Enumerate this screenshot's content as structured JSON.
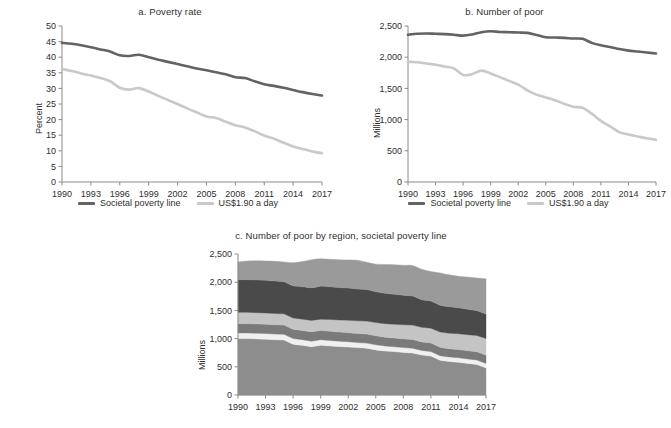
{
  "figure": {
    "background": "#ffffff",
    "series_colors": {
      "societal_poverty_line": "#636363",
      "us190_a_day": "#c9c9c9"
    },
    "region_colors": {
      "east_asia_pacific": "#8d8d8d",
      "europe_central_asia": "#f0f0f0",
      "latin_america_caribbean": "#7a7a7a",
      "middle_east_north_africa": "#c4c4c4",
      "south_asia": "#4a4a4a",
      "sub_saharan_africa": "#9a9a9a"
    }
  },
  "legend": {
    "items": [
      {
        "label": "Societal poverty line",
        "color": "#636363"
      },
      {
        "label": "US$1.90 a day",
        "color": "#c9c9c9"
      }
    ]
  },
  "chart_data": [
    {
      "id": "panel-a",
      "type": "line",
      "title": "a. Poverty rate",
      "xlabel": "",
      "ylabel": "Percent",
      "xlim": [
        1990,
        2017
      ],
      "ylim": [
        0,
        50
      ],
      "ytick_step": 5,
      "grid": false,
      "legend_position": "bottom",
      "yticks": [
        "0",
        "5",
        "10",
        "15",
        "20",
        "25",
        "30",
        "35",
        "40",
        "45",
        "50"
      ],
      "xticks": [
        "1990",
        "1993",
        "1996",
        "1999",
        "2002",
        "2005",
        "2008",
        "2011",
        "2014",
        "2017"
      ],
      "x": [
        1990,
        1991,
        1992,
        1993,
        1994,
        1995,
        1996,
        1997,
        1998,
        1999,
        2000,
        2001,
        2002,
        2003,
        2004,
        2005,
        2006,
        2007,
        2008,
        2009,
        2010,
        2011,
        2012,
        2013,
        2014,
        2015,
        2016,
        2017
      ],
      "series": [
        {
          "name": "Societal poverty line",
          "color": "#636363",
          "values": [
            44.6,
            44.3,
            43.8,
            43.2,
            42.5,
            41.8,
            40.6,
            40.4,
            40.8,
            40.0,
            39.2,
            38.5,
            37.8,
            37.1,
            36.4,
            35.8,
            35.2,
            34.5,
            33.6,
            33.3,
            32.3,
            31.3,
            30.8,
            30.2,
            29.5,
            28.8,
            28.2,
            27.7
          ]
        },
        {
          "name": "US$1.90 a day",
          "color": "#c9c9c9",
          "values": [
            36.2,
            35.6,
            34.8,
            34.1,
            33.3,
            32.3,
            30.2,
            29.6,
            30.1,
            29.0,
            27.6,
            26.3,
            25.0,
            23.6,
            22.3,
            21.0,
            20.5,
            19.3,
            18.2,
            17.5,
            16.3,
            14.9,
            13.9,
            12.6,
            11.4,
            10.6,
            9.8,
            9.2
          ]
        }
      ]
    },
    {
      "id": "panel-b",
      "type": "line",
      "title": "b. Number of poor",
      "xlabel": "",
      "ylabel": "Millions",
      "xlim": [
        1990,
        2017
      ],
      "ylim": [
        0,
        2500
      ],
      "ytick_step": 500,
      "grid": false,
      "legend_position": "bottom",
      "yticks": [
        "0",
        "500",
        "1,000",
        "1,500",
        "2,000",
        "2,500"
      ],
      "xticks": [
        "1990",
        "1993",
        "1996",
        "1999",
        "2002",
        "2005",
        "2008",
        "2011",
        "2014",
        "2017"
      ],
      "x": [
        1990,
        1991,
        1992,
        1993,
        1994,
        1995,
        1996,
        1997,
        1998,
        1999,
        2000,
        2001,
        2002,
        2003,
        2004,
        2005,
        2006,
        2007,
        2008,
        2009,
        2010,
        2011,
        2012,
        2013,
        2014,
        2015,
        2016,
        2017
      ],
      "series": [
        {
          "name": "Societal poverty line",
          "color": "#636363",
          "values": [
            2360,
            2375,
            2380,
            2375,
            2370,
            2360,
            2345,
            2365,
            2400,
            2415,
            2405,
            2400,
            2395,
            2390,
            2355,
            2320,
            2315,
            2310,
            2300,
            2295,
            2230,
            2190,
            2165,
            2130,
            2105,
            2090,
            2075,
            2060
          ]
        },
        {
          "name": "US$1.90 a day",
          "color": "#c9c9c9",
          "values": [
            1925,
            1920,
            1900,
            1880,
            1850,
            1820,
            1715,
            1730,
            1785,
            1740,
            1680,
            1620,
            1560,
            1470,
            1400,
            1355,
            1310,
            1255,
            1205,
            1190,
            1095,
            980,
            890,
            800,
            760,
            730,
            700,
            675
          ]
        }
      ]
    },
    {
      "id": "panel-c",
      "type": "area",
      "stacked": true,
      "title": "c. Number of poor by region, societal poverty line",
      "xlabel": "",
      "ylabel": "Millions",
      "xlim": [
        1990,
        2017
      ],
      "ylim": [
        0,
        2500
      ],
      "ytick_step": 500,
      "grid": false,
      "yticks": [
        "0",
        "500",
        "1,000",
        "1,500",
        "2,000",
        "2,500"
      ],
      "xticks": [
        "1990",
        "1993",
        "1996",
        "1999",
        "2002",
        "2005",
        "2008",
        "2011",
        "2014",
        "2017"
      ],
      "x": [
        1990,
        1991,
        1992,
        1993,
        1994,
        1995,
        1996,
        1997,
        1998,
        1999,
        2000,
        2001,
        2002,
        2003,
        2004,
        2005,
        2006,
        2007,
        2008,
        2009,
        2010,
        2011,
        2012,
        2013,
        2014,
        2015,
        2016,
        2017
      ],
      "series": [
        {
          "name": "Band 1",
          "color": "#8d8d8d",
          "values": [
            1000,
            1000,
            995,
            990,
            980,
            975,
            900,
            880,
            855,
            880,
            870,
            860,
            850,
            840,
            830,
            800,
            780,
            770,
            755,
            745,
            710,
            690,
            615,
            595,
            580,
            560,
            540,
            480
          ]
        },
        {
          "name": "Band 2",
          "color": "#f0f0f0",
          "values": [
            100,
            100,
            100,
            100,
            100,
            100,
            100,
            100,
            100,
            100,
            95,
            95,
            95,
            90,
            90,
            90,
            90,
            85,
            85,
            85,
            80,
            80,
            80,
            80,
            80,
            80,
            80,
            80
          ]
        },
        {
          "name": "Band 3",
          "color": "#7a7a7a",
          "values": [
            165,
            165,
            165,
            165,
            165,
            165,
            165,
            165,
            165,
            165,
            165,
            160,
            160,
            160,
            160,
            160,
            155,
            155,
            155,
            155,
            150,
            150,
            150,
            145,
            145,
            145,
            145,
            145
          ]
        },
        {
          "name": "Band 4",
          "color": "#c4c4c4",
          "values": [
            200,
            200,
            200,
            200,
            200,
            200,
            200,
            200,
            200,
            200,
            210,
            215,
            220,
            225,
            230,
            235,
            240,
            245,
            250,
            255,
            260,
            265,
            270,
            275,
            280,
            285,
            290,
            295
          ]
        },
        {
          "name": "Band 5",
          "color": "#4a4a4a",
          "values": [
            580,
            580,
            580,
            580,
            575,
            570,
            570,
            575,
            580,
            585,
            580,
            575,
            570,
            565,
            560,
            545,
            540,
            530,
            525,
            515,
            490,
            480,
            475,
            470,
            460,
            450,
            440,
            435
          ]
        },
        {
          "name": "Band 6",
          "color": "#9a9a9a",
          "values": [
            315,
            330,
            340,
            340,
            350,
            350,
            410,
            445,
            500,
            485,
            485,
            495,
            500,
            510,
            485,
            490,
            510,
            525,
            530,
            540,
            540,
            525,
            575,
            565,
            560,
            570,
            580,
            625
          ]
        }
      ]
    }
  ]
}
